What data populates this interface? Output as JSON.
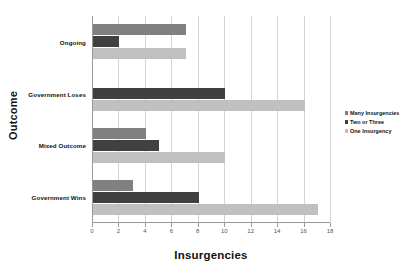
{
  "chart_data": {
    "type": "bar",
    "orientation": "horizontal",
    "title": "",
    "xlabel": "Insurgencies",
    "ylabel": "Outcome",
    "categories": [
      "Ongoing",
      "Government Loses",
      "Mixed Outcome",
      "Government Wins"
    ],
    "series": [
      {
        "name": "Many Insurgencies",
        "color": "#808080",
        "values": [
          7,
          0,
          4,
          3
        ]
      },
      {
        "name": "Two or Three",
        "color": "#404040",
        "values": [
          2,
          10,
          5,
          8
        ]
      },
      {
        "name": "One Insurgency",
        "color": "#c0c0c0",
        "values": [
          7,
          16,
          10,
          17
        ]
      }
    ],
    "xlim": [
      0,
      18
    ],
    "xticks": [
      0,
      2,
      4,
      6,
      8,
      10,
      12,
      14,
      16,
      18
    ],
    "xtick_labels": [
      "0",
      "2",
      "4",
      "6",
      "8",
      "10",
      "12",
      "14",
      "16",
      "18"
    ],
    "grid": "vertical",
    "legend_position": "right",
    "legend_entries": [
      "Many Insurgencies",
      "Two or Three",
      "One Insurgency"
    ],
    "background_color": "#ffffff",
    "gridline_color": "#d4d4d4",
    "axis_color": "#9a9a9a"
  }
}
